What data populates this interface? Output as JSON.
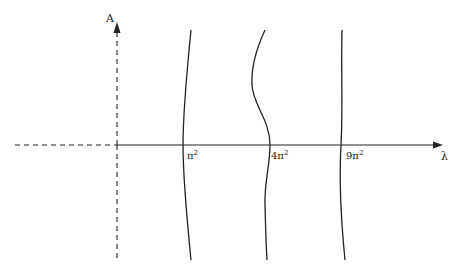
{
  "diagram": {
    "y_axis_label": "A",
    "x_axis_label": "λ",
    "curves": [
      {
        "id": "curve-1",
        "tick_base": "π",
        "tick_exp": "2",
        "label": "π²"
      },
      {
        "id": "curve-2",
        "tick_base": "4π",
        "tick_exp": "2",
        "label": "4π²"
      },
      {
        "id": "curve-3",
        "tick_base": "9π",
        "tick_exp": "2",
        "label": "9π²"
      }
    ],
    "colors": {
      "line": "#222222",
      "background": "#ffffff"
    }
  }
}
